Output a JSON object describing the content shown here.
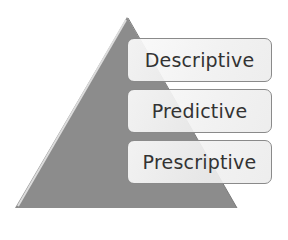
{
  "diagram": {
    "type": "pyramid",
    "levels": [
      {
        "label": "Descriptive"
      },
      {
        "label": "Predictive"
      },
      {
        "label": "Prescriptive"
      }
    ],
    "colors": {
      "triangle_fill": "#8c8c8c",
      "triangle_highlight": "#d8d8d8",
      "box_border": "#8a8a8a",
      "box_fill": "#f2f2f2",
      "text": "#333333"
    }
  }
}
